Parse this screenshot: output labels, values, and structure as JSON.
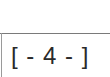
{
  "footer": {
    "page_number_text": "[ - 4 - ]",
    "page_number": 4
  },
  "colors": {
    "background": "#ffffff",
    "rule": "#7a7a7a",
    "text": "#2a2a2a"
  }
}
